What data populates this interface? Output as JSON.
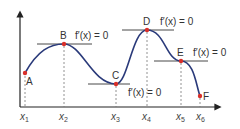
{
  "diagram": {
    "colors": {
      "curve": "#2a3a7a",
      "point": "#d9302a",
      "axis": "#222222",
      "tangent": "#333333",
      "dashed": "#777777"
    },
    "points": [
      {
        "label": "A",
        "x": 25,
        "y": 73,
        "derivative_label": ""
      },
      {
        "label": "B",
        "x": 64,
        "y": 44,
        "derivative_label": "f′(x) = 0"
      },
      {
        "label": "C",
        "x": 116,
        "y": 84,
        "derivative_label": "f′(x) = 0"
      },
      {
        "label": "D",
        "x": 147,
        "y": 30,
        "derivative_label": "f′(x) = 0"
      },
      {
        "label": "E",
        "x": 181,
        "y": 61,
        "derivative_label": "f′(x) = 0"
      },
      {
        "label": "F",
        "x": 200,
        "y": 96,
        "derivative_label": ""
      }
    ],
    "x_ticks": [
      {
        "base": "x",
        "sub": "1"
      },
      {
        "base": "x",
        "sub": "2"
      },
      {
        "base": "x",
        "sub": "3"
      },
      {
        "base": "x",
        "sub": "4"
      },
      {
        "base": "x",
        "sub": "5"
      },
      {
        "base": "x",
        "sub": "6"
      }
    ]
  }
}
